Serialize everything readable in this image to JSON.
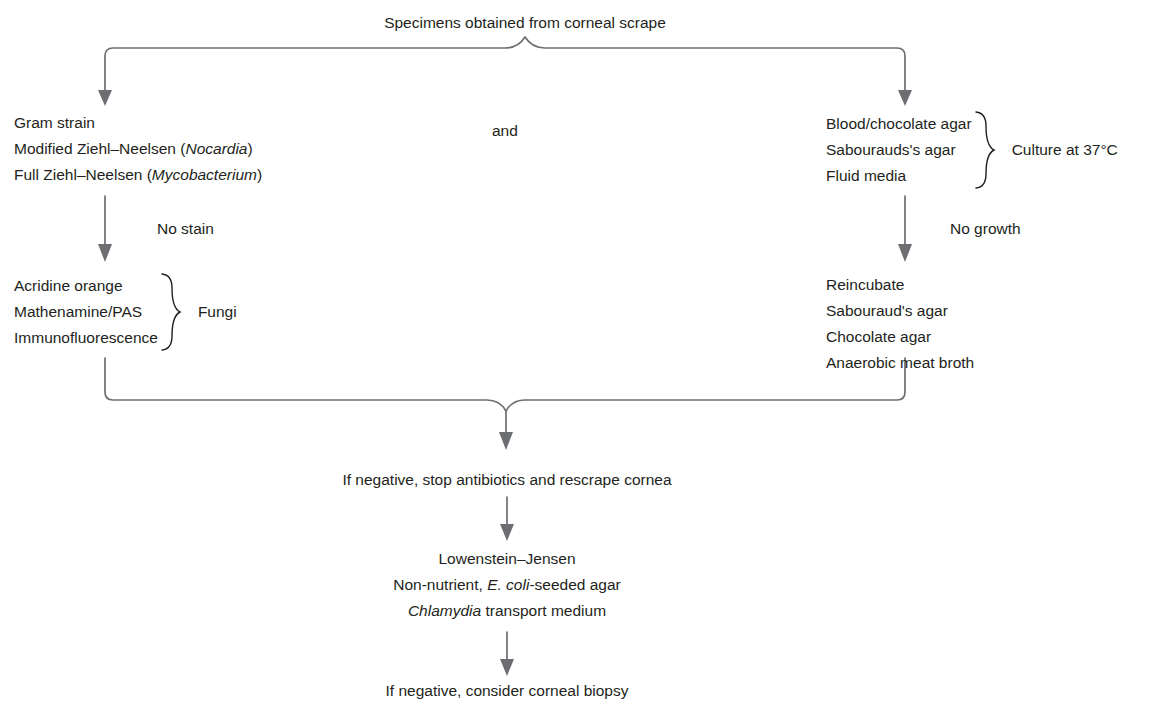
{
  "diagram": {
    "title": "Specimens obtained from corneal scrape",
    "junction_label": "and",
    "stain_block": {
      "lines": [
        "Gram strain",
        "Modified Ziehl–Neelsen (Nocardia)",
        "Full Ziehl–Neelsen (Mycobacterium)"
      ],
      "italic_terms": [
        "Nocardia",
        "Mycobacterium"
      ]
    },
    "culture_block": {
      "lines": [
        "Blood/chocolate agar",
        "Sabourauds's agar",
        "Fluid media"
      ],
      "brace_label": "Culture at 37°C"
    },
    "left_arrow_label": "No stain",
    "right_arrow_label": "No growth",
    "fungi_block": {
      "lines": [
        "Acridine orange",
        "Mathenamine/PAS",
        "Immunofluorescence"
      ],
      "brace_label": "Fungi"
    },
    "reincubate_block": {
      "lines": [
        "Reincubate",
        "Sabouraud's agar",
        "Chocolate agar",
        "Anaerobic meat broth"
      ]
    },
    "rescrape_text": "If negative, stop antibiotics and rescrape cornea",
    "media_block": {
      "lines": [
        "Lowenstein–Jensen",
        "Non-nutrient, E. coli-seeded agar",
        "Chlamydia transport medium"
      ],
      "italic_terms": [
        "E. coli",
        "Chlamydia"
      ]
    },
    "biopsy_text": "If negative, consider corneal biopsy",
    "colors": {
      "text": "#231f20",
      "connector": "#6d6e71",
      "background": "#ffffff"
    }
  }
}
